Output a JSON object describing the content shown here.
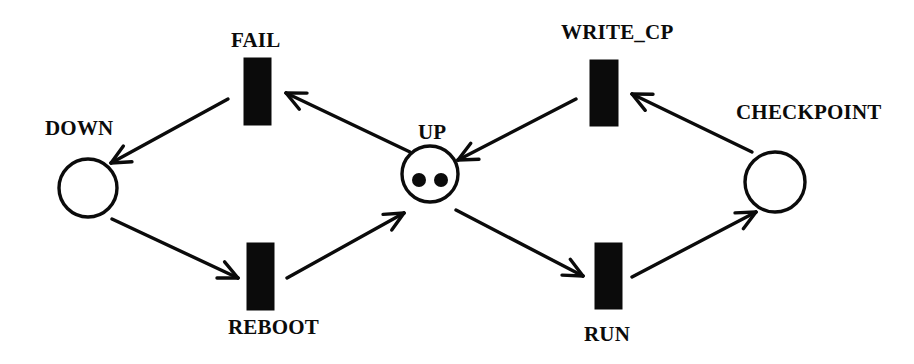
{
  "figure": {
    "name": "petri-net",
    "kind": "petri-net-diagram",
    "background_color": "#ffffff",
    "ink_color": "#0b0b0b",
    "width": 914,
    "height": 364
  },
  "places": [
    {
      "id": "down",
      "label": "DOWN",
      "shape": "circle",
      "tokens": 0,
      "cx": 88,
      "cy": 188,
      "r": 29,
      "label_x": 45,
      "label_y": 118
    },
    {
      "id": "up",
      "label": "UP",
      "shape": "circle",
      "tokens": 2,
      "cx": 430,
      "cy": 174,
      "r": 28,
      "label_x": 418,
      "label_y": 122,
      "token_positions": [
        {
          "cx": 419,
          "cy": 180,
          "r": 7
        },
        {
          "cx": 441,
          "cy": 180,
          "r": 7
        }
      ]
    },
    {
      "id": "checkpoint",
      "label": "CHECKPOINT",
      "shape": "circle",
      "tokens": 0,
      "cx": 775,
      "cy": 182,
      "r": 30,
      "label_x": 736,
      "label_y": 102
    }
  ],
  "transitions": [
    {
      "id": "fail",
      "label": "FAIL",
      "shape": "bar",
      "x": 244,
      "y": 58,
      "width": 27,
      "height": 67,
      "label_x": 231,
      "label_y": 30,
      "label_position": "above"
    },
    {
      "id": "write_cp",
      "label": "WRITE_CP",
      "shape": "bar",
      "x": 590,
      "y": 60,
      "width": 28,
      "height": 66,
      "label_x": 561,
      "label_y": 22,
      "label_position": "above"
    },
    {
      "id": "reboot",
      "label": "REBOOT",
      "shape": "bar",
      "x": 247,
      "y": 243,
      "width": 27,
      "height": 67,
      "label_x": 228,
      "label_y": 317,
      "label_position": "below"
    },
    {
      "id": "run",
      "label": "RUN",
      "shape": "bar",
      "x": 595,
      "y": 243,
      "width": 27,
      "height": 66,
      "label_x": 584,
      "label_y": 324,
      "label_position": "below"
    }
  ],
  "arcs": [
    {
      "id": "up-to-fail",
      "from": "up",
      "to": "fail",
      "x1": 410,
      "y1": 152,
      "x2": 286,
      "y2": 93
    },
    {
      "id": "fail-to-down",
      "from": "fail",
      "to": "down",
      "x1": 228,
      "y1": 99,
      "x2": 111,
      "y2": 163
    },
    {
      "id": "down-to-reboot",
      "from": "down",
      "to": "reboot",
      "x1": 112,
      "y1": 219,
      "x2": 238,
      "y2": 278
    },
    {
      "id": "reboot-to-up",
      "from": "reboot",
      "to": "up",
      "x1": 287,
      "y1": 278,
      "x2": 404,
      "y2": 213
    },
    {
      "id": "up-to-run",
      "from": "up",
      "to": "run",
      "x1": 456,
      "y1": 210,
      "x2": 583,
      "y2": 276
    },
    {
      "id": "run-to-checkpoint",
      "from": "run",
      "to": "checkpoint",
      "x1": 632,
      "y1": 277,
      "x2": 756,
      "y2": 212
    },
    {
      "id": "checkpoint-to-write_cp",
      "from": "checkpoint",
      "to": "write_cp",
      "x1": 752,
      "y1": 152,
      "x2": 632,
      "y2": 94
    },
    {
      "id": "write_cp-to-up",
      "from": "write_cp",
      "to": "up",
      "x1": 576,
      "y1": 99,
      "x2": 458,
      "y2": 160
    }
  ]
}
